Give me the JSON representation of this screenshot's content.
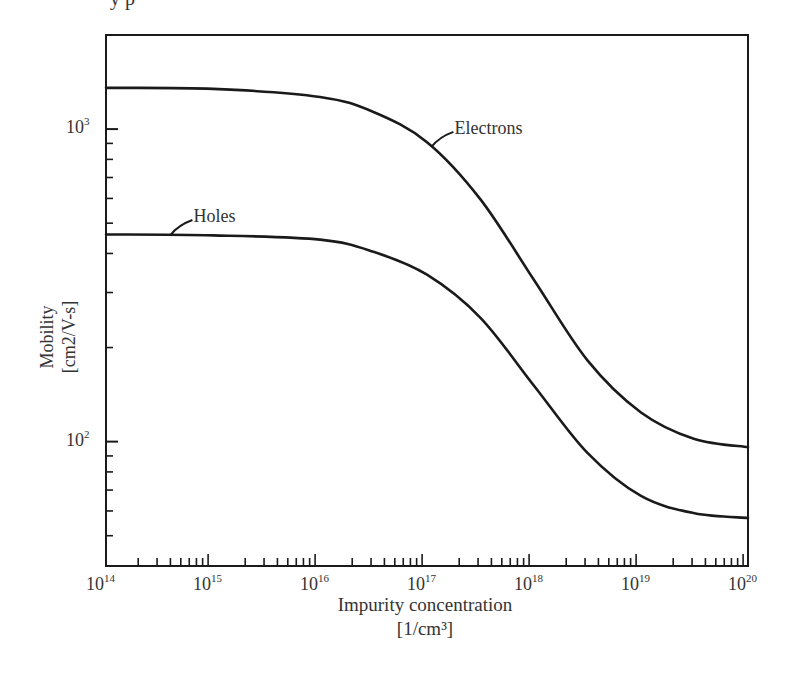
{
  "page": {
    "cut_off_header_text": "y  p"
  },
  "chart_data": {
    "type": "line",
    "title": "",
    "xlabel": "Impurity concentration",
    "xlabel_unit": "[1/cm³]",
    "ylabel": "Mobility",
    "ylabel_unit": "[cm2/V-s]",
    "xscale": "log",
    "yscale": "log",
    "xlim": [
      100000000000000.0,
      1e+20
    ],
    "ylim": [
      40,
      2000
    ],
    "grid": false,
    "legend": "inline annotations",
    "x_tick_labels": [
      {
        "base": "10",
        "exp": "14",
        "value": 100000000000000.0
      },
      {
        "base": "10",
        "exp": "15",
        "value": 1000000000000000.0
      },
      {
        "base": "10",
        "exp": "16",
        "value": 1e+16
      },
      {
        "base": "10",
        "exp": "17",
        "value": 1e+17
      },
      {
        "base": "10",
        "exp": "18",
        "value": 1e+18
      },
      {
        "base": "10",
        "exp": "19",
        "value": 1e+19
      },
      {
        "base": "10",
        "exp": "20",
        "value": 1e+20
      }
    ],
    "y_tick_labels": [
      {
        "base": "10",
        "exp": "3",
        "value": 1000
      },
      {
        "base": "10",
        "exp": "2",
        "value": 100
      }
    ],
    "x": [
      100000000000000.0,
      1000000000000000.0,
      1e+16,
      3.16e+16,
      1e+17,
      3.16e+17,
      1e+18,
      3.16e+18,
      1e+19,
      3.16e+19,
      1e+20
    ],
    "series": [
      {
        "name": "Electrons",
        "values": [
          1355,
          1345,
          1267,
          1134,
          908,
          596,
          329,
          182,
          124,
          102,
          96
        ],
        "annotation": {
          "label": "Electrons",
          "x": 1.1e+17
        }
      },
      {
        "name": "Holes",
        "values": [
          460,
          457,
          443,
          405,
          342,
          249,
          151,
          92,
          67,
          59,
          57
        ],
        "annotation": {
          "label": "Holes",
          "x": 400000000000000.0
        }
      }
    ],
    "colors": {
      "line": "#1a1a1a",
      "axis": "#1a1a1a",
      "text": "#333333",
      "background": "#ffffff"
    }
  }
}
